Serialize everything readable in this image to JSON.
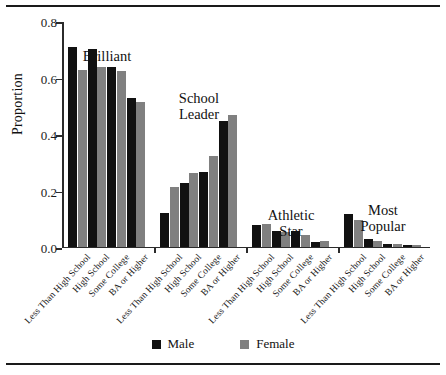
{
  "figure": {
    "ylabel": "Proportion",
    "legend": [
      {
        "label": "Male",
        "color": "#111111",
        "key": "male"
      },
      {
        "label": "Female",
        "color": "#808080",
        "key": "female"
      }
    ]
  },
  "chart_data": {
    "type": "bar",
    "title": "",
    "xlabel": "",
    "ylabel": "Proportion",
    "ylim": [
      0.0,
      0.8
    ],
    "yticks": [
      0.0,
      0.2,
      0.4,
      0.6,
      0.8
    ],
    "ytick_labels": [
      "0.0",
      "0.2",
      "0.4",
      "0.6",
      "0.8"
    ],
    "grid": false,
    "legend_position": "bottom-center",
    "group_labels": [
      "Brilliant",
      "School\nLeader",
      "Athletic\nStar",
      "Most\nPopular"
    ],
    "categories": [
      "Less Than High School",
      "High School",
      "Some College",
      "BA or Higher"
    ],
    "groups": [
      {
        "name": "Brilliant",
        "series": [
          {
            "name": "Male",
            "values": [
              0.705,
              0.7,
              0.635,
              0.525
            ]
          },
          {
            "name": "Female",
            "values": [
              0.625,
              0.635,
              0.62,
              0.51
            ]
          }
        ]
      },
      {
        "name": "School Leader",
        "series": [
          {
            "name": "Male",
            "values": [
              0.12,
              0.225,
              0.265,
              0.445
            ]
          },
          {
            "name": "Female",
            "values": [
              0.21,
              0.26,
              0.32,
              0.465
            ]
          }
        ]
      },
      {
        "name": "Athletic Star",
        "series": [
          {
            "name": "Male",
            "values": [
              0.075,
              0.055,
              0.055,
              0.015
            ]
          },
          {
            "name": "Female",
            "values": [
              0.08,
              0.05,
              0.04,
              0.02
            ]
          }
        ]
      },
      {
        "name": "Most Popular",
        "series": [
          {
            "name": "Male",
            "values": [
              0.115,
              0.025,
              0.01,
              0.005
            ]
          },
          {
            "name": "Female",
            "values": [
              0.095,
              0.02,
              0.01,
              0.005
            ]
          }
        ]
      }
    ]
  }
}
